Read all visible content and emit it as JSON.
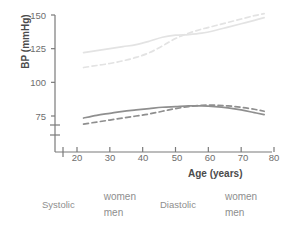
{
  "chart_data": {
    "type": "line",
    "title": "",
    "xlabel": "Age (years)",
    "ylabel": "BP (mmHg)",
    "xlim": [
      17,
      81
    ],
    "ylim": [
      60,
      152
    ],
    "xticks": [
      20,
      30,
      40,
      50,
      60,
      70,
      80
    ],
    "yticks": [
      75,
      100,
      125,
      150
    ],
    "grid": false,
    "axis_break": true,
    "axis_break_note": "y-axis broken below 75 mmHg",
    "legend_position": "below-plot",
    "series": [
      {
        "name": "Systolic women",
        "measure": "Systolic",
        "group": "women",
        "style": "dashed",
        "color": "#e3e3e3",
        "x": [
          22,
          26,
          30,
          34,
          38,
          42,
          46,
          50,
          54,
          58,
          62,
          66,
          70,
          74,
          77
        ],
        "values": [
          111.0,
          112.5,
          114.0,
          116.0,
          118.5,
          122.0,
          127.0,
          132.5,
          136.5,
          139.5,
          142.0,
          144.5,
          147.0,
          149.5,
          151.0
        ]
      },
      {
        "name": "Systolic men",
        "measure": "Systolic",
        "group": "men",
        "style": "solid",
        "color": "#e3e3e3",
        "x": [
          22,
          26,
          30,
          34,
          38,
          42,
          46,
          50,
          54,
          58,
          62,
          66,
          70,
          74,
          77
        ],
        "values": [
          122.0,
          123.5,
          125.0,
          126.5,
          128.0,
          130.5,
          133.5,
          135.0,
          135.5,
          136.5,
          138.5,
          141.0,
          143.5,
          146.0,
          148.0
        ]
      },
      {
        "name": "Diastolic women",
        "measure": "Diastolic",
        "group": "women",
        "style": "dashed",
        "color": "#8f8f8f",
        "x": [
          22,
          26,
          30,
          34,
          38,
          42,
          46,
          50,
          54,
          58,
          62,
          66,
          70,
          74,
          77
        ],
        "values": [
          69.0,
          70.5,
          72.0,
          73.5,
          75.0,
          76.5,
          78.5,
          80.5,
          82.0,
          83.0,
          83.0,
          82.5,
          81.5,
          80.0,
          78.5
        ]
      },
      {
        "name": "Diastolic men",
        "measure": "Diastolic",
        "group": "men",
        "style": "solid",
        "color": "#8f8f8f",
        "x": [
          22,
          26,
          30,
          34,
          38,
          42,
          46,
          50,
          54,
          58,
          62,
          66,
          70,
          74,
          77
        ],
        "values": [
          73.5,
          75.5,
          77.0,
          78.5,
          79.5,
          80.5,
          81.5,
          82.0,
          82.5,
          82.5,
          82.0,
          81.0,
          79.5,
          77.5,
          76.0
        ]
      }
    ]
  },
  "axis": {
    "y_title": "BP (mmHg)",
    "x_title": "Age (years)",
    "y_ticks": [
      "150",
      "125",
      "100",
      "75"
    ],
    "x_ticks": [
      "20",
      "30",
      "40",
      "50",
      "60",
      "70",
      "80"
    ]
  },
  "legend": {
    "groups": [
      {
        "title": "Systolic",
        "color": "#dcdcdc",
        "entries": [
          {
            "label": "women",
            "style": "dashed"
          },
          {
            "label": "men",
            "style": "solid"
          }
        ]
      },
      {
        "title": "Diastolic",
        "color": "#8f8f8f",
        "entries": [
          {
            "label": "women",
            "style": "dashed"
          },
          {
            "label": "men",
            "style": "solid"
          }
        ]
      }
    ]
  },
  "colors": {
    "systolic": "#e3e3e3",
    "diastolic": "#8f8f8f",
    "axis": "#7a7a7a",
    "tick_text": "#6e6e6e",
    "title_text": "#4b4b4b",
    "legend_text": "#8e8e8e",
    "background": "#ffffff"
  }
}
